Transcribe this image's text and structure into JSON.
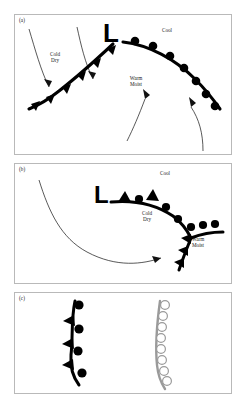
{
  "figure": {
    "background_color": "#ffffff",
    "panel_border_color": "#b9b9b9",
    "ink_color": "#111111",
    "front_color": "#000000",
    "gray_front_color": "#9a9a9a"
  },
  "panels": [
    {
      "id": "a",
      "label": "(a)",
      "low_symbol": "L",
      "air_masses": [
        {
          "name": "cold-dry",
          "text": "Cold\nDry"
        },
        {
          "name": "cool",
          "text": "Cool"
        },
        {
          "name": "warm-moist",
          "text": "Warm\nMoist"
        }
      ],
      "fronts": [
        {
          "type": "cold-front",
          "symbol": "filled-triangles",
          "color": "#000000"
        },
        {
          "type": "warm-front",
          "symbol": "filled-semicircles",
          "color": "#000000"
        }
      ],
      "flow_arrows": 4
    },
    {
      "id": "b",
      "label": "(b)",
      "low_symbol": "L",
      "air_masses": [
        {
          "name": "cool",
          "text": "Cool"
        },
        {
          "name": "cold-dry",
          "text": "Cold\nDry"
        },
        {
          "name": "warm-moist",
          "text": "Warm\nMoist"
        }
      ],
      "fronts": [
        {
          "type": "occluded-front",
          "symbol": "alternating-triangles-and-semicircles",
          "color": "#000000"
        },
        {
          "type": "cold-front",
          "symbol": "filled-triangles",
          "color": "#000000"
        },
        {
          "type": "warm-front",
          "symbol": "filled-semicircles",
          "color": "#000000"
        }
      ],
      "flow_arrows": 1
    },
    {
      "id": "c",
      "label": "(c)",
      "symbols": [
        {
          "name": "occluded-front-symbol",
          "style": "solid-black",
          "marks": "alternating-triangles-and-semicircles",
          "color": "#000000"
        },
        {
          "name": "stationary-or-upper-front-symbol",
          "style": "gray-outline",
          "marks": "open-semicircles",
          "color": "#9a9a9a"
        }
      ]
    }
  ]
}
